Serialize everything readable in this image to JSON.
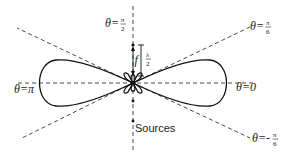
{
  "diagram": {
    "type": "radiation pattern of two sources",
    "labels": {
      "theta_half_pi": {
        "prefix": "θ=",
        "num": "π",
        "den": "2"
      },
      "theta_sixth_pi": {
        "prefix": "θ=",
        "num": "π",
        "den": "6"
      },
      "theta_neg_sixth_pi": {
        "prefix": "θ=-",
        "num": "π",
        "den": "6"
      },
      "theta_pi": "θ=π",
      "theta_zero": "θ=0",
      "f": "f",
      "lambda_half": {
        "num": "λ",
        "den": "2"
      },
      "sources": "Sources"
    },
    "colors": {
      "line": "#111111",
      "dash": "#333333",
      "background": "#ffffff"
    }
  }
}
